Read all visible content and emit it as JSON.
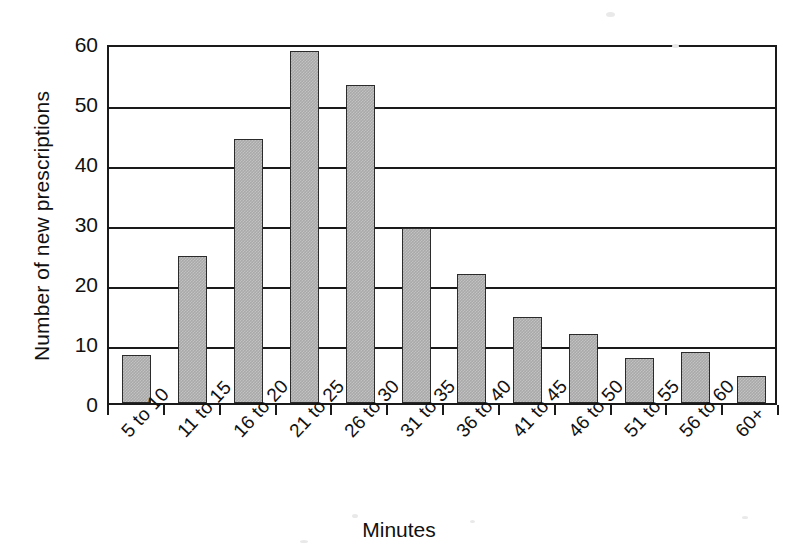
{
  "chart_data": {
    "type": "bar",
    "title": "",
    "xlabel": "Minutes",
    "ylabel": "Number of new prescriptions",
    "categories": [
      "5 to 10",
      "11 to 15",
      "16 to 20",
      "21 to 25",
      "26 to 30",
      "31 to 35",
      "36 to 40",
      "41 to 45",
      "46 to 50",
      "51 to 55",
      "56 to 60",
      "60+"
    ],
    "values": [
      8,
      24.5,
      44,
      58.7,
      53,
      29.2,
      21.5,
      14.4,
      11.5,
      7.5,
      8.5,
      4.5
    ],
    "ylim": [
      0,
      60
    ],
    "yticks": [
      0,
      10,
      20,
      30,
      40,
      50,
      60
    ],
    "ytick_labels": [
      "0",
      "10",
      "20",
      "30",
      "40",
      "50",
      "60"
    ],
    "grid": "horizontal",
    "legend": "none",
    "bar_fill_color": "#a9a9a9",
    "bar_border_color": "#2b2b2b",
    "axis_color": "#1a1a1a",
    "background_color": "#ffffff"
  }
}
